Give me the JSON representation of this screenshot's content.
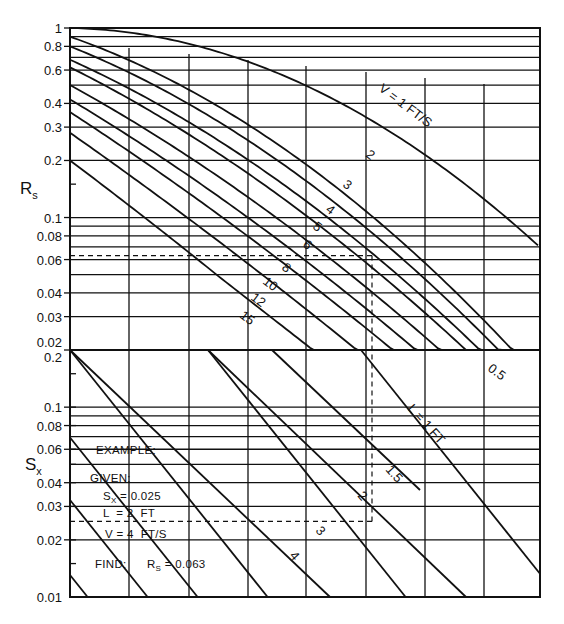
{
  "chart_data": {
    "type": "line",
    "title": "",
    "panels": [
      {
        "name": "upper",
        "ylabel": "Rs",
        "yscale": "log",
        "ylim": [
          0.02,
          1
        ],
        "yticks": [
          1,
          0.8,
          0.6,
          0.4,
          0.3,
          0.2,
          0.1,
          0.08,
          0.06,
          0.04,
          0.03,
          0.02
        ],
        "ytick_labels": [
          "1",
          "0.8",
          "0.6",
          "0.4",
          "0.3",
          "0.2",
          "0.1",
          "0.08",
          "0.06",
          "0.04",
          "0.03",
          "0.02"
        ],
        "grid": true,
        "series_label_prefix": "V =",
        "series_unit": "FT/S",
        "series": [
          {
            "name": "V = 1 FT/S",
            "label": "V = 1 FT/S",
            "y_at_left": 1.0
          },
          {
            "name": "V = 2",
            "label": "2",
            "y_at_left": 0.9
          },
          {
            "name": "V = 3",
            "label": "3",
            "y_at_left": 0.8
          },
          {
            "name": "V = 4",
            "label": "4",
            "y_at_left": 0.68
          },
          {
            "name": "V = 5",
            "label": "5",
            "y_at_left": 0.62
          },
          {
            "name": "V = 6",
            "label": "6",
            "y_at_left": 0.5
          },
          {
            "name": "V = 8",
            "label": "8",
            "y_at_left": 0.42
          },
          {
            "name": "V = 10",
            "label": "10",
            "y_at_left": 0.36
          },
          {
            "name": "V = 12",
            "label": "12",
            "y_at_left": 0.28
          },
          {
            "name": "V = 15",
            "label": "15",
            "y_at_left": 0.2
          }
        ]
      },
      {
        "name": "lower",
        "ylabel": "Sx",
        "yscale": "log",
        "ylim": [
          0.01,
          0.2
        ],
        "yticks": [
          0.2,
          0.1,
          0.08,
          0.06,
          0.04,
          0.03,
          0.02,
          0.01
        ],
        "ytick_labels": [
          "0.2",
          "0.1",
          "0.08",
          "0.06",
          "0.04",
          "0.03",
          "0.02",
          "0.01"
        ],
        "grid": true,
        "series_label_prefix": "L =",
        "series_unit": "FT",
        "series": [
          {
            "name": "L = 0.5",
            "label": "0.5"
          },
          {
            "name": "L = 1 FT",
            "label": "L = 1 FT"
          },
          {
            "name": "L = 1.5",
            "label": "1.5"
          },
          {
            "name": "L = 2",
            "label": "2"
          },
          {
            "name": "L = 3",
            "label": "3"
          },
          {
            "name": "L = 4",
            "label": "4"
          }
        ]
      }
    ],
    "example": {
      "heading": "EXAMPLE:",
      "given_label": "GIVEN:",
      "given": [
        {
          "symbol": "S",
          "sub": "X",
          "text": " = 0.025"
        },
        {
          "symbol": "L",
          "sub": "",
          "text": "  = 2  FT"
        },
        {
          "symbol": "V",
          "sub": "",
          "text": " = 4  FT/S"
        }
      ],
      "find_label": "FIND:",
      "find": {
        "symbol": "R",
        "sub": "S",
        "text": " = 0.063"
      },
      "solution_path": {
        "Sx": 0.025,
        "L": 2,
        "V": 4,
        "Rs": 0.063
      }
    }
  },
  "labels": {
    "rs_axis": "R",
    "rs_sub": "s",
    "sx_axis": "S",
    "sx_sub": "x",
    "v_curve_top": "V =  1  FT/S",
    "l_curve_main": "L =  1  FT",
    "l_half": "0.5",
    "l_1_5": "1.5",
    "l_2": "2",
    "l_3": "3",
    "l_4": "4",
    "v2": "2",
    "v3": "3",
    "v4": "4",
    "v5": "5",
    "v6": "6",
    "v8": "8",
    "v10": "10",
    "v12": "12",
    "v15": "15"
  },
  "colors": {
    "ink": "#111111",
    "paper": "#ffffff"
  }
}
